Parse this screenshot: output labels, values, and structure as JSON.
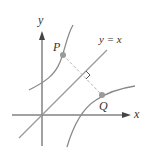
{
  "diagram": {
    "title": "",
    "axes": {
      "x_label": "x",
      "y_label": "y"
    },
    "line": {
      "label": "y = x"
    },
    "points": [
      {
        "id": "P",
        "label": "P"
      },
      {
        "id": "Q",
        "label": "Q"
      }
    ],
    "colors": {
      "axis": "#444444",
      "curve": "#8a8a8a",
      "line": "#9a9a9a",
      "dashed": "#b5b5b5",
      "point": "#9a9a9a",
      "text": "#333333"
    }
  }
}
